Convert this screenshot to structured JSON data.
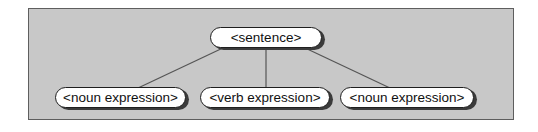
{
  "diagram": {
    "nodes": [
      {
        "label": "<sentence>"
      },
      {
        "label": "<noun expression>"
      },
      {
        "label": "<verb expression>"
      },
      {
        "label": "<noun expression>"
      }
    ],
    "edges": [
      {
        "from": 0,
        "to": 1
      },
      {
        "from": 0,
        "to": 2
      },
      {
        "from": 0,
        "to": 3
      }
    ],
    "colors": {
      "frame_background": "#c8c8c8",
      "frame_border": "#5e5e5e",
      "node_fill": "#ffffff",
      "node_border": "#1f1f1f",
      "node_shadow": "#3b3b3b",
      "edge_line": "#555555",
      "text": "#111111"
    }
  }
}
